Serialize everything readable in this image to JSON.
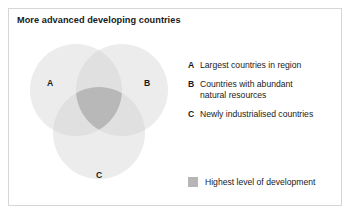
{
  "figure": {
    "title": "More advanced developing countries",
    "type": "venn-diagram-3-set"
  },
  "venn": {
    "sets": [
      {
        "key": "A",
        "label": "A",
        "cx": 57,
        "cy": 54,
        "r": 46
      },
      {
        "key": "B",
        "label": "B",
        "cx": 103,
        "cy": 54,
        "r": 46
      },
      {
        "key": "C",
        "label": "C",
        "cx": 80,
        "cy": 97,
        "r": 46
      }
    ],
    "fill_single": "#ececec",
    "fill_double": "#e0e0e0",
    "fill_triple": "#b8b8b8"
  },
  "legend": {
    "items": [
      {
        "key": "A",
        "text": "Largest countries in region"
      },
      {
        "key": "B",
        "text": "Countries with abundant\nnatural  resources"
      },
      {
        "key": "C",
        "text": "Newly industrialised countries"
      }
    ]
  },
  "swatch_legend": {
    "color": "#b6b6b6",
    "label": "Highest level of development"
  },
  "colors": {
    "text": "#1a1a1a",
    "frame_border": "#d6d6d6",
    "background": "#ffffff"
  }
}
